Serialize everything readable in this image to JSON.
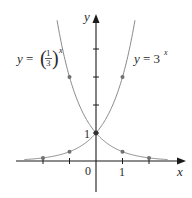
{
  "chart_data": {
    "type": "line",
    "title": "",
    "xlabel": "x",
    "ylabel": "y",
    "xlim": [
      -2.4,
      2.7
    ],
    "ylim": [
      -0.5,
      5.1
    ],
    "grid": false,
    "x_tick_labels": [
      {
        "value": 0,
        "label": "0"
      },
      {
        "value": 1,
        "label": "1"
      }
    ],
    "x_ticks": [
      -2,
      -1,
      1,
      2
    ],
    "y_ticks": [
      1,
      2,
      3,
      4
    ],
    "y_tick_labels": [
      {
        "value": 1,
        "label": "1"
      }
    ],
    "series": [
      {
        "name": "y = (1/3)^x",
        "label_parts": {
          "lhs": "y = ",
          "num": "1",
          "den": "3",
          "exp": "x"
        },
        "function": "(1/3)^x",
        "marked_points": [
          [
            -2,
            9
          ],
          [
            -1,
            3
          ],
          [
            0,
            1
          ],
          [
            1,
            0.3333
          ],
          [
            2,
            0.1111
          ]
        ],
        "visible_points": [
          [
            -1,
            3
          ],
          [
            0,
            1
          ],
          [
            1,
            0.3333
          ],
          [
            2,
            0.1111
          ]
        ]
      },
      {
        "name": "y = 3^x",
        "label_parts": {
          "lhs": "y = 3",
          "exp": "x"
        },
        "function": "3^x",
        "marked_points": [
          [
            -2,
            0.1111
          ],
          [
            -1,
            0.3333
          ],
          [
            0,
            1
          ],
          [
            1,
            3
          ]
        ],
        "visible_points": [
          [
            -2,
            0.1111
          ],
          [
            -1,
            0.3333
          ],
          [
            0,
            1
          ],
          [
            1,
            3
          ]
        ]
      }
    ],
    "intersection": {
      "x": 0,
      "y": 1
    }
  },
  "axes": {
    "x_label": "x",
    "y_label": "y",
    "origin_label": "0",
    "x_one_label": "1",
    "y_one_label": "1"
  },
  "labels": {
    "left_curve": {
      "lhs": "y = ",
      "num": "1",
      "den": "3",
      "exp": "x"
    },
    "right_curve": {
      "lhs": "y = 3",
      "exp": "x"
    }
  },
  "colors": {
    "axis": "#1a1a1a",
    "curve": "#8a8a8a",
    "point": "#707070",
    "text": "#2a2a2a"
  }
}
